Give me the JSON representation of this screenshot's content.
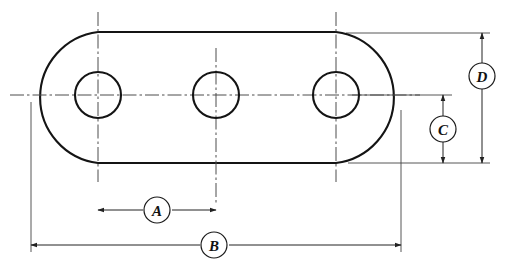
{
  "drawing": {
    "title": "Obround plate with three holes - dimensioned engineering drawing",
    "type": "mechanical-part-outline",
    "units_shown": "none",
    "line_color": "#1a1a1a",
    "center_line_color": "#555555",
    "dimension_line_color": "#333333",
    "background_color": "#ffffff",
    "part": {
      "name": "obround-plate",
      "outline": "stadium",
      "arc_radius": 66,
      "left_arc_center_x": 98,
      "right_arc_center_x": 336,
      "center_y": 95,
      "top_edge_y": 32,
      "bottom_edge_y": 163,
      "left_extreme_x": 31,
      "right_extreme_x": 401
    },
    "holes": [
      {
        "name": "hole-left",
        "cx": 98,
        "cy": 95,
        "r": 23
      },
      {
        "name": "hole-middle",
        "cx": 216,
        "cy": 95,
        "r": 23
      },
      {
        "name": "hole-right",
        "cx": 336,
        "cy": 95,
        "r": 23
      }
    ],
    "center_lines": {
      "horizontal": {
        "y": 95,
        "x1": 10,
        "x2": 420
      },
      "vertical_left": {
        "x": 98,
        "y1": 12,
        "y2": 182
      },
      "vertical_middle": {
        "x": 216,
        "y1": 48,
        "y2": 205
      },
      "vertical_right": {
        "x": 336,
        "y1": 12,
        "y2": 182
      }
    },
    "dimensions": [
      {
        "id": "A",
        "label": "A",
        "orientation": "horizontal",
        "from_x": 98,
        "to_x": 216,
        "line_y": 210,
        "balloon_cx": 157,
        "balloon_cy": 210,
        "description": "hole spacing between left and middle hole centres"
      },
      {
        "id": "B",
        "label": "B",
        "orientation": "horizontal",
        "from_x": 31,
        "to_x": 401,
        "line_y": 245,
        "balloon_cx": 214,
        "balloon_cy": 245,
        "description": "overall length of plate"
      },
      {
        "id": "C",
        "label": "C",
        "orientation": "vertical",
        "from_y": 95,
        "to_y": 163,
        "line_x": 443,
        "balloon_cx": 443,
        "balloon_cy": 129,
        "description": "centre line to bottom edge (half height)"
      },
      {
        "id": "D",
        "label": "D",
        "orientation": "vertical",
        "from_y": 33,
        "to_y": 163,
        "line_x": 482,
        "balloon_cx": 482,
        "balloon_cy": 76,
        "description": "overall height of plate"
      }
    ],
    "extension_lines": [
      {
        "name": "ext-left-vertical",
        "x1": 31,
        "y1": 102,
        "x2": 31,
        "y2": 252
      },
      {
        "name": "ext-right-vertical",
        "x1": 401,
        "y1": 108,
        "x2": 401,
        "y2": 252
      },
      {
        "name": "ext-top-horizontal",
        "x1": 345,
        "y1": 33,
        "x2": 490,
        "y2": 33
      },
      {
        "name": "ext-center-horizontal",
        "x1": 355,
        "y1": 95,
        "x2": 452,
        "y2": 95
      },
      {
        "name": "ext-bottom-horizontal",
        "x1": 350,
        "y1": 163,
        "x2": 490,
        "y2": 163
      }
    ]
  }
}
